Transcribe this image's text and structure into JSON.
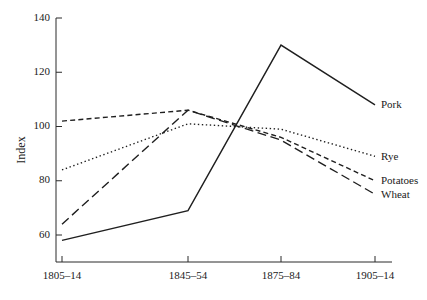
{
  "chart_data": {
    "type": "line",
    "title": "",
    "xlabel": "",
    "ylabel": "Index",
    "categories": [
      "1805–14",
      "1845–54",
      "1875–84",
      "1905–14"
    ],
    "ylim": [
      50,
      140
    ],
    "yticks": [
      60,
      80,
      100,
      120,
      140
    ],
    "ytick_labels": [
      "60",
      "80",
      "100",
      "120",
      "140"
    ],
    "grid": false,
    "legend_position": "right-inline-labels",
    "series": [
      {
        "name": "Pork",
        "values": [
          58,
          69,
          130,
          108
        ],
        "style": "solid",
        "label": "Pork"
      },
      {
        "name": "Rye",
        "values": [
          84,
          101,
          99,
          89
        ],
        "style": "dotted",
        "label": "Rye"
      },
      {
        "name": "Potatoes",
        "values": [
          102,
          106,
          96,
          80
        ],
        "style": "dashed",
        "label": "Potatoes"
      },
      {
        "name": "Wheat",
        "values": [
          64,
          106,
          95,
          75
        ],
        "style": "long-dashed",
        "label": "Wheat"
      }
    ]
  },
  "axis": {
    "y_title": "Index",
    "y_labels": [
      "140",
      "120",
      "100",
      "80",
      "60"
    ],
    "x_labels": [
      "1805–14",
      "1845–54",
      "1875–84",
      "1905–14"
    ]
  },
  "series_labels": {
    "pork": "Pork",
    "rye": "Rye",
    "potatoes": "Potatoes",
    "wheat": "Wheat"
  }
}
